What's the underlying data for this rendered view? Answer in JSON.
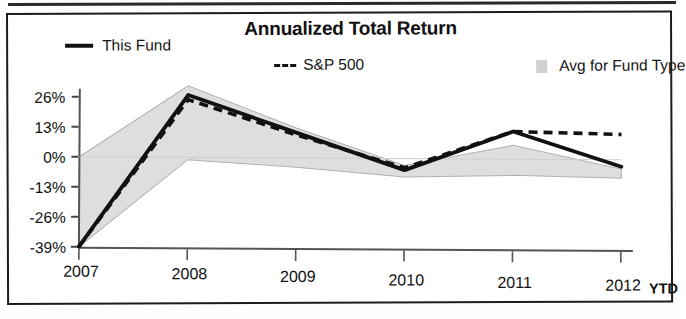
{
  "chart_data": {
    "type": "line",
    "title": "Annualized Total Return",
    "xlabel": "",
    "ylabel": "",
    "x_axis_note": "YTD",
    "categories": [
      "2007",
      "2008",
      "2009",
      "2010",
      "2011",
      "2012"
    ],
    "ytick_labels": [
      "26%",
      "13%",
      "0%",
      "-13%",
      "-26%",
      "-39%"
    ],
    "ytick_values": [
      26,
      13,
      0,
      -13,
      -26,
      -39
    ],
    "ylim": [
      -39,
      33
    ],
    "grid": false,
    "legend_position": "top",
    "series": [
      {
        "name": "This Fund",
        "style": "solid",
        "color": "#111111",
        "values": [
          -39,
          27,
          11,
          -5,
          12,
          -3
        ]
      },
      {
        "name": "S&P 500",
        "style": "dashed",
        "color": "#111111",
        "values": [
          -39,
          25,
          10,
          -4,
          12,
          11
        ]
      },
      {
        "name": "Avg for Fund Type",
        "style": "band",
        "color": "#c9c9c9",
        "band_upper": [
          0,
          31,
          13,
          -3,
          6,
          -4
        ],
        "band_lower": [
          -39,
          -1,
          -4,
          -8,
          -7,
          -8
        ]
      }
    ]
  },
  "legend": {
    "fund_label": "This Fund",
    "sp_label": "S&P 500",
    "avg_label": "Avg for Fund Type"
  },
  "axis": {
    "ytd": "YTD"
  }
}
